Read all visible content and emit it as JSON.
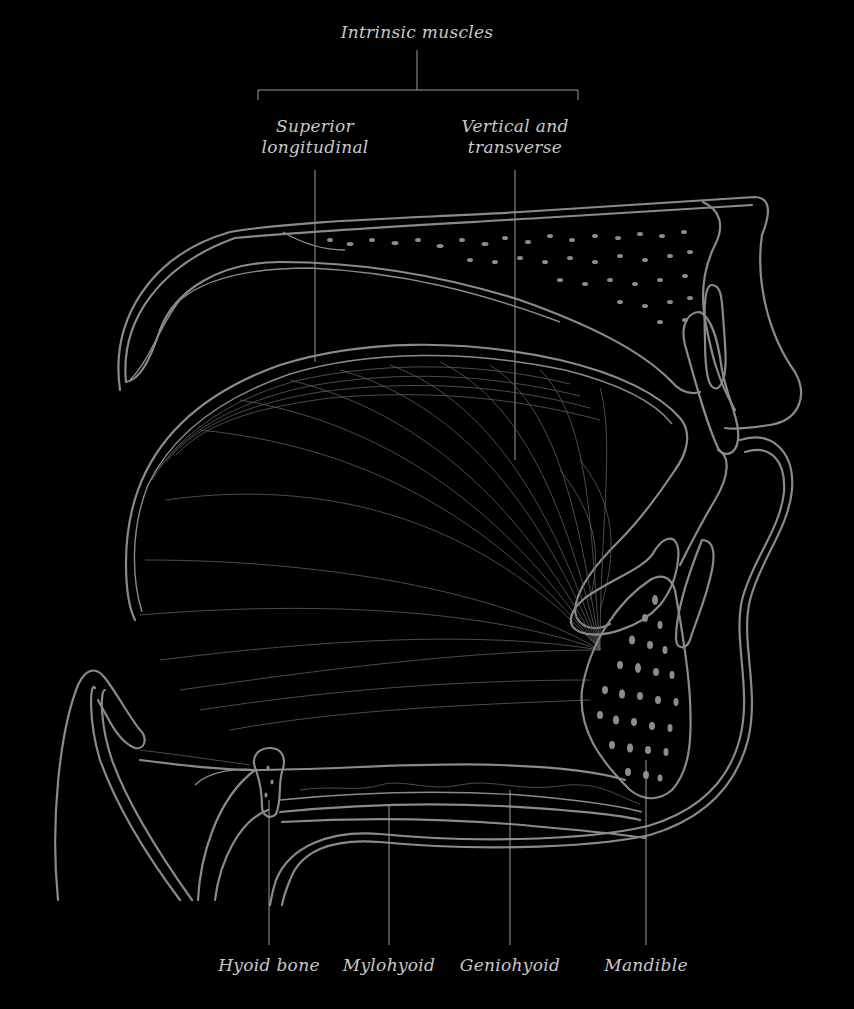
{
  "diagram": {
    "colors": {
      "background": "#000000",
      "outline": "#8a8a8a",
      "label": "#c8c8c8",
      "fiber": "#5e5e5e"
    },
    "group_label": {
      "text": "Intrinsic muscles",
      "x": 417,
      "y": 22
    },
    "top_labels": [
      {
        "id": "superior-longitudinal",
        "line1": "Superior",
        "line2": "longitudinal",
        "x": 315,
        "y": 116,
        "leader_x": 315
      },
      {
        "id": "vertical-and-transverse",
        "line1": "Vertical and",
        "line2": "transverse",
        "x": 515,
        "y": 116,
        "leader_x": 515
      }
    ],
    "bottom_labels": [
      {
        "id": "hyoid-bone",
        "text": "Hyoid bone",
        "x": 269,
        "y": 955,
        "leader_x": 269
      },
      {
        "id": "mylohyoid",
        "text": "Mylohyoid",
        "x": 389,
        "y": 955,
        "leader_x": 389
      },
      {
        "id": "geniohyoid",
        "text": "Geniohyoid",
        "x": 510,
        "y": 955,
        "leader_x": 510
      },
      {
        "id": "mandible",
        "text": "Mandible",
        "x": 646,
        "y": 955,
        "leader_x": 646
      }
    ]
  }
}
